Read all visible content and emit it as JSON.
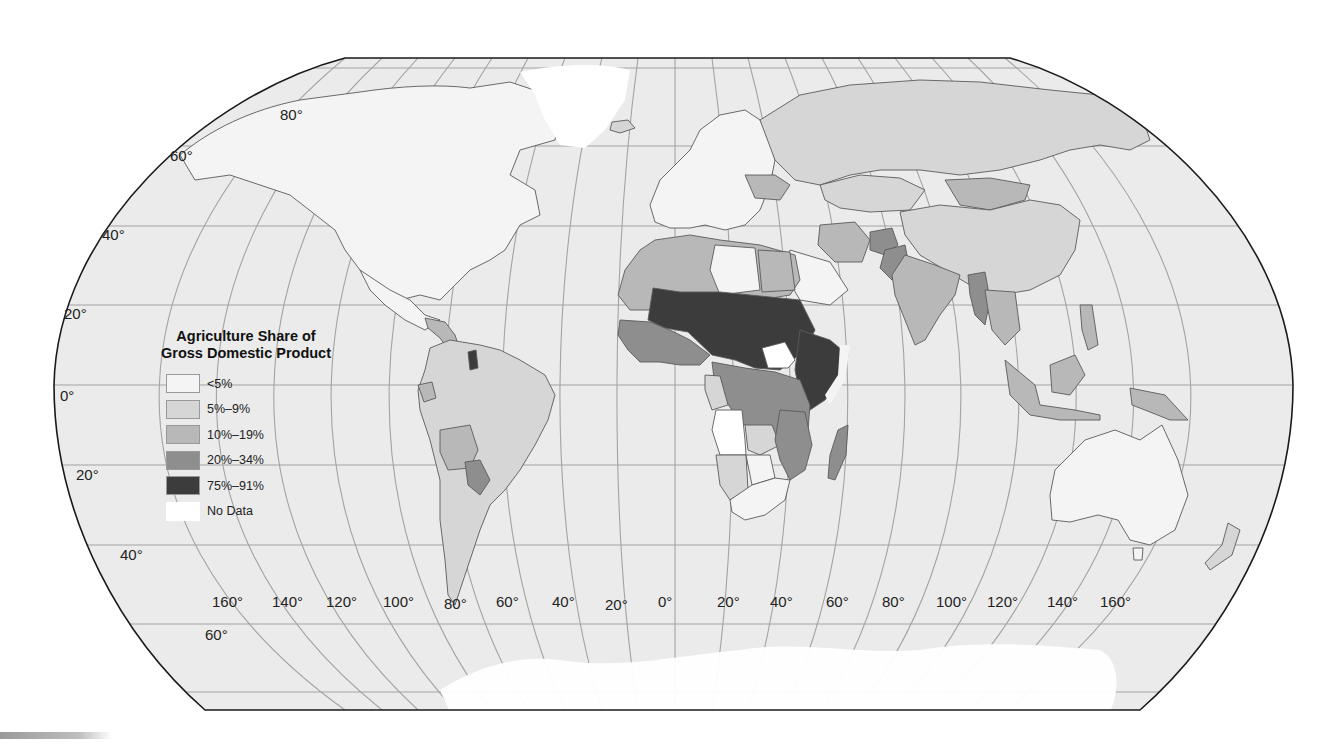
{
  "map": {
    "projection": "Robinson",
    "title_lines": [
      "Agriculture Share of",
      "Gross Domestic Product"
    ],
    "colors": {
      "ocean": "#ebebeb",
      "outline": "#1a1a1a",
      "grid": "#a3a3a3",
      "border": "#5a5a5a"
    },
    "legend": {
      "title_line1": "Agriculture Share of",
      "title_line2": "Gross Domestic Product",
      "items": [
        {
          "label": "<5%",
          "color": "#f4f4f4"
        },
        {
          "label": "5%–9%",
          "color": "#d6d6d6"
        },
        {
          "label": "10%–19%",
          "color": "#b8b8b8"
        },
        {
          "label": "20%–34%",
          "color": "#8e8e8e"
        },
        {
          "label": "75%–91%",
          "color": "#3c3c3c"
        },
        {
          "label": "No Data",
          "color": "#ffffff"
        }
      ]
    },
    "latitude_labels": [
      {
        "text": "80°",
        "x": 280,
        "y": 106
      },
      {
        "text": "60°",
        "x": 170,
        "y": 147
      },
      {
        "text": "40°",
        "x": 102,
        "y": 226
      },
      {
        "text": "20°",
        "x": 64,
        "y": 305
      },
      {
        "text": "0°",
        "x": 60,
        "y": 387
      },
      {
        "text": "20°",
        "x": 76,
        "y": 466
      },
      {
        "text": "40°",
        "x": 120,
        "y": 546
      },
      {
        "text": "60°",
        "x": 205,
        "y": 626
      }
    ],
    "longitude_labels": [
      {
        "text": "160°",
        "x": 212,
        "y": 593
      },
      {
        "text": "140°",
        "x": 272,
        "y": 593
      },
      {
        "text": "120°",
        "x": 326,
        "y": 593
      },
      {
        "text": "100°",
        "x": 383,
        "y": 593
      },
      {
        "text": "80°",
        "x": 444,
        "y": 595
      },
      {
        "text": "60°",
        "x": 496,
        "y": 593
      },
      {
        "text": "40°",
        "x": 552,
        "y": 593
      },
      {
        "text": "20°",
        "x": 605,
        "y": 596
      },
      {
        "text": "0°",
        "x": 658,
        "y": 593
      },
      {
        "text": "20°",
        "x": 717,
        "y": 593
      },
      {
        "text": "40°",
        "x": 770,
        "y": 593
      },
      {
        "text": "60°",
        "x": 826,
        "y": 593
      },
      {
        "text": "80°",
        "x": 882,
        "y": 593
      },
      {
        "text": "100°",
        "x": 936,
        "y": 593
      },
      {
        "text": "120°",
        "x": 987,
        "y": 593
      },
      {
        "text": "140°",
        "x": 1047,
        "y": 593
      },
      {
        "text": "160°",
        "x": 1100,
        "y": 593
      }
    ],
    "regions": [
      {
        "name": "North America (US, Canada)",
        "category": "<5%"
      },
      {
        "name": "Greenland",
        "category": "No Data"
      },
      {
        "name": "Mexico",
        "category": "<5%"
      },
      {
        "name": "Central America",
        "category": "10%–19%"
      },
      {
        "name": "South America (Brazil, Argentina, Colombia, Venezuela, Peru, Chile)",
        "category": "5%–9%"
      },
      {
        "name": "Bolivia",
        "category": "10%–19%"
      },
      {
        "name": "Paraguay",
        "category": "20%–34%"
      },
      {
        "name": "Ecuador",
        "category": "10%–19%"
      },
      {
        "name": "Guyana",
        "category": "75%–91%"
      },
      {
        "name": "Europe",
        "category": "<5%"
      },
      {
        "name": "Ukraine",
        "category": "10%–19%"
      },
      {
        "name": "Russia",
        "category": "5%–9%"
      },
      {
        "name": "Kazakhstan",
        "category": "5%–9%"
      },
      {
        "name": "Mongolia",
        "category": "10%–19%"
      },
      {
        "name": "China",
        "category": "5%–9%"
      },
      {
        "name": "Iran",
        "category": "10%–19%"
      },
      {
        "name": "Afghanistan",
        "category": "20%–34%"
      },
      {
        "name": "Pakistan",
        "category": "20%–34%"
      },
      {
        "name": "India",
        "category": "10%–19%"
      },
      {
        "name": "Myanmar",
        "category": "20%–34%"
      },
      {
        "name": "Southeast Asia",
        "category": "10%–19%"
      },
      {
        "name": "Indonesia",
        "category": "10%–19%"
      },
      {
        "name": "Papua New Guinea",
        "category": "10%–19%"
      },
      {
        "name": "Australia",
        "category": "<5%"
      },
      {
        "name": "New Zealand",
        "category": "5%–9%"
      },
      {
        "name": "Saudi Arabia",
        "category": "<5%"
      },
      {
        "name": "Morocco / Algeria",
        "category": "10%–19%"
      },
      {
        "name": "Libya",
        "category": "<5%"
      },
      {
        "name": "Egypt",
        "category": "10%–19%"
      },
      {
        "name": "Sahel (Mali, Niger, Chad, Sudan)",
        "category": "75%–91%"
      },
      {
        "name": "Ethiopia / Somalia",
        "category": "75%–91%"
      },
      {
        "name": "South Sudan",
        "category": "No Data"
      },
      {
        "name": "West Africa coast",
        "category": "20%–34%"
      },
      {
        "name": "Nigeria",
        "category": "20%–34%"
      },
      {
        "name": "DR Congo",
        "category": "20%–34%"
      },
      {
        "name": "Gabon / Congo",
        "category": "5%–9%"
      },
      {
        "name": "Angola",
        "category": "No Data"
      },
      {
        "name": "Tanzania / Mozambique",
        "category": "20%–34%"
      },
      {
        "name": "Zambia",
        "category": "5%–9%"
      },
      {
        "name": "Namibia",
        "category": "5%–9%"
      },
      {
        "name": "Botswana",
        "category": "<5%"
      },
      {
        "name": "South Africa",
        "category": "<5%"
      },
      {
        "name": "Madagascar",
        "category": "20%–34%"
      },
      {
        "name": "Antarctica",
        "category": "No Data"
      }
    ]
  }
}
